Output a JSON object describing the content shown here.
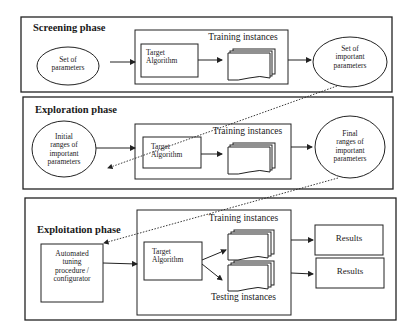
{
  "diagram": {
    "phases": [
      {
        "title": "Screening phase",
        "input": "Set of parameters",
        "input_lines": [
          "Set of",
          "parameters"
        ],
        "algorithm": [
          "Target",
          "Algorithm"
        ],
        "instances_label": "Training instances",
        "output_lines": [
          "Set of",
          "important",
          "parameters"
        ]
      },
      {
        "title": "Exploration phase",
        "input_lines": [
          "Initial",
          "ranges of",
          "important",
          "parameters"
        ],
        "algorithm": [
          "Target",
          "Algorithm"
        ],
        "instances_label": "Training instances",
        "output_lines": [
          "Final",
          "ranges of",
          "important",
          "parameters"
        ]
      },
      {
        "title": "Exploitation phase",
        "input_lines": [
          "Automated",
          "tuning",
          "procedure /",
          "configurator"
        ],
        "algorithm": [
          "Target",
          "Algorithm"
        ],
        "instances_label": "Training instances",
        "testing_label": "Testing instances",
        "results": [
          "Results",
          "Results"
        ]
      }
    ],
    "colors": {
      "stroke": "#222222",
      "background": "#ffffff"
    }
  }
}
